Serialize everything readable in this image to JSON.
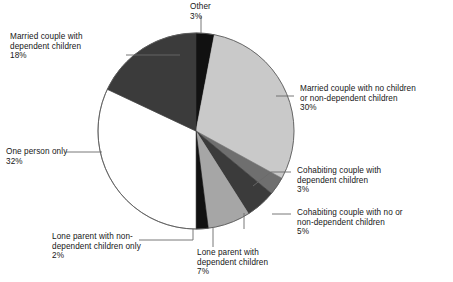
{
  "chart_data": {
    "type": "pie",
    "title": "",
    "subtitle": "",
    "xlabel": "",
    "ylabel": "",
    "legend_position": "callout-labels",
    "grid": false,
    "units": "percent",
    "total": 100,
    "start_angle_deg": 0,
    "direction": "clockwise",
    "categories": [
      "Other",
      "Married couple with no children or non-dependent children",
      "Cohabiting couple with dependent children",
      "Cohabiting couple with no or non-dependent children",
      "Lone parent with dependent children",
      "Lone parent with non-dependent children only",
      "One person only",
      "Married couple with dependent children"
    ],
    "values": [
      3,
      30,
      3,
      5,
      7,
      2,
      32,
      18
    ],
    "slices": [
      {
        "id": "other",
        "label": "Other",
        "value": 3,
        "value_text": "3%",
        "color": "#111111",
        "start_deg": 0,
        "end_deg": 10.8
      },
      {
        "id": "married-no-children",
        "label": "Married couple with no children",
        "label_line2": "or non-dependent children",
        "value": 30,
        "value_text": "30%",
        "color": "#c9c9c9",
        "start_deg": 10.8,
        "end_deg": 118.8
      },
      {
        "id": "cohabiting-dependent",
        "label": "Cohabiting couple with",
        "label_line2": "dependent children",
        "value": 3,
        "value_text": "3%",
        "color": "#6f6f6f",
        "start_deg": 118.8,
        "end_deg": 129.6
      },
      {
        "id": "cohabiting-no-children",
        "label": "Cohabiting couple with no or",
        "label_line2": "non-dependent children",
        "value": 5,
        "value_text": "5%",
        "color": "#3b3b3b",
        "start_deg": 129.6,
        "end_deg": 147.6
      },
      {
        "id": "lone-parent-dependent",
        "label": "Lone parent with",
        "label_line2": "dependent children",
        "value": 7,
        "value_text": "7%",
        "color": "#a6a6a6",
        "start_deg": 147.6,
        "end_deg": 172.8
      },
      {
        "id": "lone-parent-non-dep",
        "label": "Lone parent with non-",
        "label_line2": "dependent children only",
        "value": 2,
        "value_text": "2%",
        "color": "#111111",
        "start_deg": 172.8,
        "end_deg": 180.0
      },
      {
        "id": "one-person-only",
        "label": "One person only",
        "value": 32,
        "value_text": "32%",
        "color": "#ffffff",
        "start_deg": 180.0,
        "end_deg": 295.2
      },
      {
        "id": "married-dependent",
        "label": "Married couple with",
        "label_line2": "dependent children",
        "value": 18,
        "value_text": "18%",
        "color": "#3b3b3b",
        "start_deg": 295.2,
        "end_deg": 360.0
      }
    ]
  },
  "labels": {
    "other": {
      "line1": "Other",
      "line2": "",
      "pct": "3%"
    },
    "married_no_children": {
      "line1": "Married couple with no children",
      "line2": "or non-dependent children",
      "pct": "30%"
    },
    "cohabiting_dependent": {
      "line1": "Cohabiting couple with",
      "line2": "dependent children",
      "pct": "3%"
    },
    "cohabiting_no_children": {
      "line1": "Cohabiting couple with no or",
      "line2": "non-dependent children",
      "pct": "5%"
    },
    "lone_parent_dependent": {
      "line1": "Lone parent with",
      "line2": "dependent children",
      "pct": "7%"
    },
    "lone_parent_non_dep": {
      "line1": "Lone parent with non-",
      "line2": "dependent children only",
      "pct": "2%"
    },
    "one_person_only": {
      "line1": "One person only",
      "line2": "",
      "pct": "32%"
    },
    "married_dependent": {
      "line1": "Married couple with",
      "line2": "dependent children",
      "pct": "18%"
    }
  },
  "caption": {
    "text": ""
  },
  "colors": {
    "outline": "#5a5a5a",
    "leader_line": "#6a6a6a",
    "text": "#161616",
    "background": "#ffffff"
  }
}
